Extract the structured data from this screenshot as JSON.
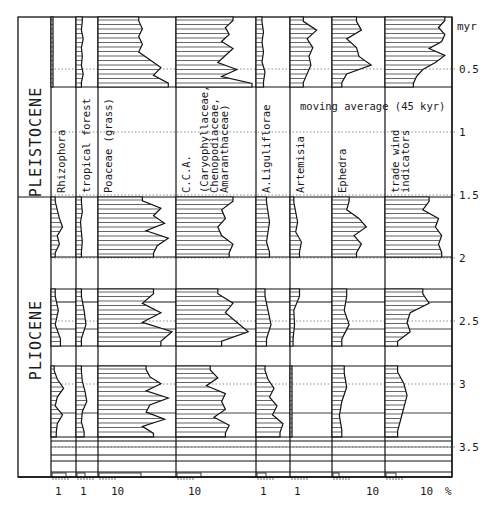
{
  "chart_data": {
    "type": "area",
    "title": "",
    "annotation": "moving average (45 kyr)",
    "ylabel": "myr",
    "xlabel": "%",
    "y_axis": {
      "unit_label": "myr",
      "ticks": [
        "0.5",
        "1",
        "1.5",
        "2",
        "2.5",
        "3",
        "3.5"
      ],
      "tick_values": [
        0.5,
        1,
        1.5,
        2,
        2.5,
        3,
        3.5
      ],
      "range": [
        0.1,
        3.75
      ],
      "inverted": true
    },
    "epochs": [
      {
        "name": "PLEISTOCENE",
        "from": 0.1,
        "to": 1.8
      },
      {
        "name": "PLIOCENE",
        "from": 1.8,
        "to": 3.75
      }
    ],
    "data_sections_myr": [
      [
        0.1,
        0.65
      ],
      [
        1.78,
        2.22
      ],
      [
        2.48,
        2.77
      ],
      [
        2.95,
        3.47
      ]
    ],
    "columns": [
      {
        "name": "Rhizophora",
        "scale_tick": "1",
        "scale": "log"
      },
      {
        "name": "tropical forest",
        "scale_tick": "1",
        "scale": "log"
      },
      {
        "name": "Poaceae (grass)",
        "scale_tick": "10",
        "scale": "log"
      },
      {
        "name": "C.C.A. (Caryophyllaceae, Chenopodiaceae, Amaranthaceae)",
        "scale_tick": "10",
        "scale": "log"
      },
      {
        "name": "A.Liguliflorae",
        "scale_tick": "1",
        "scale": "log"
      },
      {
        "name": "Artemisia",
        "scale_tick": "1",
        "scale": "log"
      },
      {
        "name": "Ephedra",
        "scale_tick": "10",
        "scale": "log"
      },
      {
        "name": "trade wind indicators",
        "scale_tick": "10",
        "scale": "log"
      }
    ],
    "series_profiles_frac": {
      "note": "relative curve width (0-1 of column) per section, top to bottom",
      "Rhizophora": [
        [
          0.02,
          0.02,
          0.1,
          0.05,
          0.02,
          0.02
        ],
        [
          0.2,
          0.3,
          0.4,
          0.55,
          0.3,
          0.4,
          0.2
        ],
        [
          0.2,
          0.35,
          0.2,
          0.45
        ],
        [
          0.15,
          0.3,
          0.6,
          0.3,
          0.2,
          0.55,
          0.3,
          0.25
        ]
      ],
      "tropical_forest": [
        [
          0.35,
          0.3,
          0.4,
          0.3,
          0.35,
          0.3,
          0.4,
          0.3
        ],
        [
          0.3,
          0.35,
          0.25,
          0.3,
          0.35,
          0.3
        ],
        [
          0.3,
          0.45,
          0.55,
          0.3
        ],
        [
          0.3,
          0.35,
          0.5,
          0.6,
          0.35,
          0.3,
          0.45
        ]
      ],
      "Poaceae": [
        [
          0.55,
          0.6,
          0.55,
          0.6,
          0.55,
          0.7,
          0.85,
          0.75,
          0.95
        ],
        [
          0.6,
          0.85,
          0.75,
          0.9,
          0.65,
          0.95,
          0.8,
          0.75
        ],
        [
          0.75,
          0.6,
          0.85,
          0.6,
          1.0,
          0.85
        ],
        [
          0.65,
          0.7,
          0.85,
          0.65,
          0.95,
          0.7,
          0.65,
          0.9,
          0.6,
          0.75
        ]
      ],
      "CCA": [
        [
          0.75,
          0.65,
          0.7,
          0.6,
          0.75,
          0.65,
          0.55,
          0.8,
          0.6,
          1.0
        ],
        [
          0.75,
          0.6,
          0.65,
          0.55,
          0.6,
          0.75,
          0.7
        ],
        [
          0.55,
          0.75,
          0.65,
          0.8,
          0.95,
          0.6
        ],
        [
          0.45,
          0.55,
          0.4,
          0.65,
          0.6,
          0.65,
          0.5,
          0.7,
          0.65
        ]
      ],
      "A_Liguliflorae": [
        [
          0.2,
          0.25,
          0.2,
          0.25,
          0.2,
          0.3,
          0.25
        ],
        [
          0.35,
          0.4,
          0.45,
          0.4,
          0.35,
          0.45
        ],
        [
          0.3,
          0.4,
          0.5,
          0.35
        ],
        [
          0.3,
          0.4,
          0.6,
          0.45,
          0.7,
          0.55,
          0.9,
          0.8
        ]
      ],
      "Artemisia": [
        [
          0.35,
          0.7,
          0.45,
          0.6,
          0.5,
          0.55,
          0.45,
          0.35
        ],
        [
          0.1,
          0.15,
          0.2,
          0.15,
          0.3,
          0.25
        ],
        [
          0.25,
          0.1,
          0.12,
          0.08
        ],
        [
          0.04,
          0.04,
          0.04,
          0.04
        ]
      ],
      "Ephedra": [
        [
          0.5,
          0.6,
          0.3,
          0.5,
          0.55,
          0.8,
          0.3,
          0.2
        ],
        [
          0.35,
          0.3,
          0.55,
          0.7,
          0.45,
          0.6,
          0.5
        ],
        [
          0.3,
          0.25,
          0.35,
          0.2
        ],
        [
          0.25,
          0.3,
          0.2,
          0.15,
          0.2
        ]
      ],
      "trade_wind": [
        [
          0.95,
          0.85,
          0.95,
          0.9,
          0.7,
          0.95,
          0.8,
          0.6,
          0.5,
          0.45
        ],
        [
          0.7,
          0.6,
          0.85,
          0.8,
          0.9,
          0.85,
          0.9
        ],
        [
          0.6,
          0.7,
          0.4,
          0.35,
          0.4,
          0.2
        ],
        [
          0.2,
          0.3,
          0.35,
          0.3,
          0.25,
          0.2
        ]
      ]
    },
    "x_tick_labels": [
      "1",
      "1",
      "10",
      "10",
      "1",
      "1",
      "10",
      "10",
      "%"
    ],
    "legend": [],
    "grid": false
  }
}
